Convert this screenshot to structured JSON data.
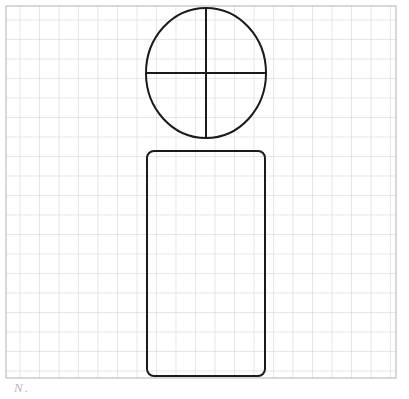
{
  "page": {
    "background_color": "#ffffff",
    "width": 409,
    "height": 399
  },
  "grid": {
    "name": "graph-paper-grid",
    "origin_x": 6,
    "origin_y": 6,
    "right": 396,
    "bottom": 378,
    "cell_size": 19.5,
    "columns": 20,
    "rows": 19,
    "line_color": "#c9cacb",
    "border_color": "#c2c3c4",
    "line_width": 0.9
  },
  "figure": {
    "stroke_color": "#1a1a1a",
    "stroke_width": 2.0,
    "fill": "none",
    "shapes": [
      {
        "id": "head-circle",
        "type": "circle",
        "label": "Circle",
        "center_x": 206,
        "center_y": 73,
        "radius_x": 60,
        "radius_y": 65,
        "top": 8,
        "bottom": 138,
        "left": 146,
        "right": 266
      },
      {
        "id": "vertical-diameter",
        "type": "line",
        "label": "Vertical diameter",
        "x1": 206,
        "y1": 8,
        "x2": 206,
        "y2": 138
      },
      {
        "id": "horizontal-diameter",
        "type": "line",
        "label": "Horizontal diameter",
        "x1": 146,
        "y1": 73,
        "x2": 266,
        "y2": 73
      },
      {
        "id": "body-rectangle",
        "type": "rounded-rectangle",
        "label": "Rounded rectangle",
        "x": 147,
        "y": 151,
        "width": 118,
        "height": 225,
        "corner_radius": 7
      }
    ]
  },
  "annotation": {
    "name": "handwritten-mark",
    "text": "N.",
    "color": "#b9b9b9",
    "x": 14,
    "y": 381
  }
}
